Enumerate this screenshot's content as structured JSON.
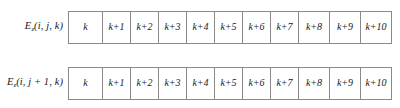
{
  "figure": {
    "type": "index-grid-diagram",
    "border_color": "#8a8a8a",
    "background_color": "#ffffff",
    "text_color": "#1a1a1a"
  },
  "rows": [
    {
      "label_base": "E",
      "label_subscript": "z",
      "label_args": "(i, j, k)",
      "cells": [
        "k",
        "k+1",
        "k+2",
        "k+3",
        "k+4",
        "k+5",
        "k+6",
        "k+7",
        "k+8",
        "k+9",
        "k+10"
      ]
    },
    {
      "label_base": "E",
      "label_subscript": "z",
      "label_args": "(i, j + 1, k)",
      "cells": [
        "k",
        "k+1",
        "k+2",
        "k+3",
        "k+4",
        "k+5",
        "k+6",
        "k+7",
        "k+8",
        "k+9",
        "k+10"
      ]
    }
  ]
}
